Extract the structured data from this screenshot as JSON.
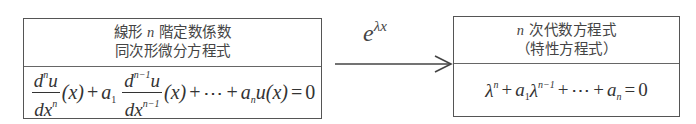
{
  "left_box": {
    "title_line1_prefix": "線形",
    "title_line1_var": "n",
    "title_line1_suffix": "階定数係数",
    "title_line2": "同次形微分方程式",
    "equation": {
      "term1_num_base": "d",
      "term1_num_sup": "n",
      "term1_num_tail": "u",
      "term1_den_base": "dx",
      "term1_den_sup": "n",
      "arg": "(x)",
      "plus": "+",
      "coef1": "a",
      "coef1_sub": "1",
      "term2_num_base": "d",
      "term2_num_sup": "n−1",
      "term2_num_tail": "u",
      "term2_den_base": "dx",
      "term2_den_sup": "n−1",
      "ellipsis": "⋯",
      "coefn": "a",
      "coefn_sub": "n",
      "func": "u",
      "equals": "=",
      "rhs": "0",
      "text": "d^n u/dx^n (x) + a_1 d^{n-1}u/dx^{n-1} (x) + ⋯ + a_n u(x) = 0"
    }
  },
  "arrow": {
    "label_base": "e",
    "label_sup": "λx",
    "text": "e^{λx}"
  },
  "right_box": {
    "title_line1_var": "n",
    "title_line1_suffix": "次代数方程式",
    "title_line2": "（特性方程式）",
    "equation": {
      "lambda": "λ",
      "sup_n": "n",
      "plus": "+",
      "coef1": "a",
      "coef1_sub": "1",
      "sup_n1": "n−1",
      "ellipsis": "⋯",
      "coefn": "a",
      "coefn_sub": "n",
      "equals": "=",
      "rhs": "0",
      "text": "λ^n + a_1 λ^{n-1} + ⋯ + a_n = 0"
    }
  }
}
